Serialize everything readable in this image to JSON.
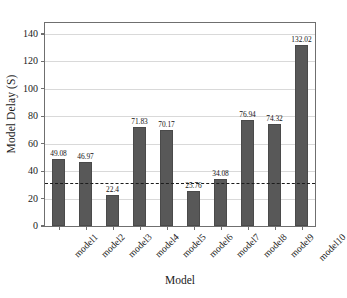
{
  "chart_data": {
    "type": "bar",
    "title": "",
    "xlabel": "Model",
    "ylabel": "Model Delay (S)",
    "categories": [
      "model1",
      "model2",
      "model3",
      "model4",
      "model5",
      "model6",
      "model7",
      "model8",
      "model9",
      "model10"
    ],
    "values": [
      49.08,
      46.97,
      22.4,
      71.83,
      70.17,
      25.76,
      34.08,
      76.94,
      74.32,
      132.02
    ],
    "value_labels": [
      "49.08",
      "46.97",
      "22.4",
      "71.83",
      "70.17",
      "25.76",
      "34.08",
      "76.94",
      "74.32",
      "132.02"
    ],
    "ylim": [
      0,
      148
    ],
    "yticks": [
      0,
      20,
      40,
      60,
      80,
      100,
      120,
      140
    ],
    "ytick_labels": [
      "0",
      "20",
      "40",
      "60",
      "80",
      "100",
      "120",
      "140"
    ],
    "grid": true,
    "legend": "none",
    "bar_color": "#585858",
    "threshold_line": {
      "value": 31.0,
      "style": "dashed",
      "color": "#1c1c1c"
    }
  }
}
